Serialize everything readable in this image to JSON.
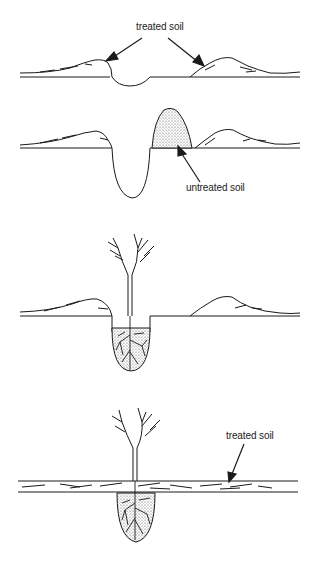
{
  "diagram": {
    "panels": [
      {
        "id": "panel-1",
        "labels": [
          {
            "text": "treated soil"
          }
        ]
      },
      {
        "id": "panel-2",
        "labels": [
          {
            "text": "untreated soil"
          }
        ]
      },
      {
        "id": "panel-3",
        "labels": []
      },
      {
        "id": "panel-4",
        "labels": [
          {
            "text": "treated soil"
          }
        ]
      }
    ],
    "colors": {
      "ink": "#1a1a1a",
      "stipple": "#c8c8c8",
      "background": "#ffffff"
    }
  }
}
